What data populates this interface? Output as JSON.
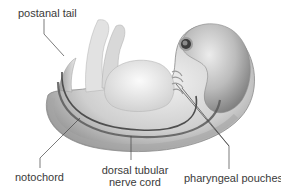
{
  "diagram": {
    "labels": {
      "postanal_tail": "postanal tail",
      "notochord": "notochord",
      "nerve_cord_line1": "dorsal tubular",
      "nerve_cord_line2": "nerve cord",
      "pharyngeal_pouches": "pharyngeal pouches"
    },
    "colors": {
      "background": "#ffffff",
      "label_text": "#3a3a3a",
      "leader_line": "#444444",
      "body_light": "#e6e6e6",
      "body_mid": "#bdbdbd",
      "body_dark": "#7a7a7a",
      "cord_dark": "#555555"
    }
  }
}
